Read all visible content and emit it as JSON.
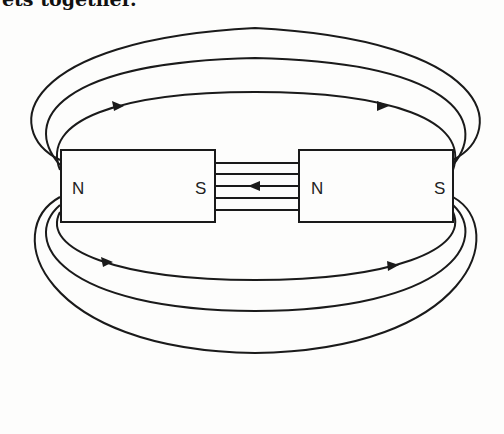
{
  "caption": "ets together.",
  "diagram": {
    "magnets": [
      {
        "name": "left-magnet",
        "left_pole": "N",
        "right_pole": "S"
      },
      {
        "name": "right-magnet",
        "left_pole": "N",
        "right_pole": "S"
      }
    ],
    "gap_lines": 5,
    "gap_arrow_direction": "left",
    "outer_loops_top": 3,
    "outer_loops_bottom": 3,
    "loop_arrow_direction": "right",
    "colors": {
      "line": "#1a1a1a",
      "background": "#fdfdfc"
    }
  }
}
